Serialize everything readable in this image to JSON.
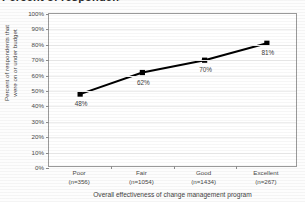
{
  "figure": {
    "cut_off_title": "Percent of respondents on or under budget",
    "background_color": "#ffffff",
    "line_color": "#000000",
    "marker_color": "#000000",
    "grid_color": "#ededed",
    "axis_color": "#9a9a9a"
  },
  "chart_data": {
    "type": "line",
    "title": "",
    "xlabel": "Overall effectiveness of change management program",
    "ylabel": "Percent of respondents that were on or under budget",
    "ylabel_line1": "Percent of respondents that",
    "ylabel_line2": "were on or under budget",
    "categories": [
      "Poor",
      "Fair",
      "Good",
      "Excellent"
    ],
    "category_counts": [
      "(n=356)",
      "(n=1054)",
      "(n=1434)",
      "(n=267)"
    ],
    "values": [
      48,
      62,
      70,
      81
    ],
    "point_labels": [
      "48%",
      "62%",
      "70%",
      "81%"
    ],
    "ylim": [
      0,
      100
    ],
    "ytick_values": [
      0,
      10,
      20,
      30,
      40,
      50,
      60,
      70,
      80,
      90,
      100
    ],
    "ytick_labels": [
      "0%",
      "10%",
      "20%",
      "30%",
      "40%",
      "50%",
      "60%",
      "70%",
      "80%",
      "90%",
      "100%"
    ],
    "grid": true,
    "grid_axis": "y",
    "legend": false,
    "legend_position": "none",
    "marker": "square",
    "series": [
      {
        "name": "Percent on or under budget",
        "values": [
          48,
          62,
          70,
          81
        ]
      }
    ]
  }
}
